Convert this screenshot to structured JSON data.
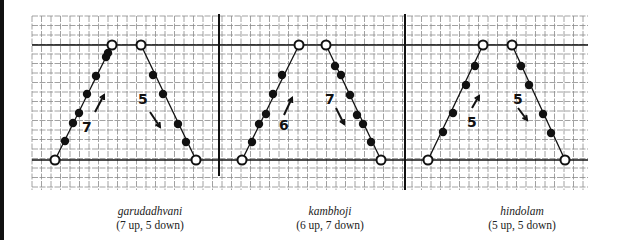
{
  "figure": {
    "grid": {
      "x0": 32,
      "x1": 588,
      "y0": 16,
      "y1": 190,
      "spacing": 9.5,
      "color": "#8a8a8a"
    },
    "bold_lines": {
      "horizontal": [
        45,
        160
      ],
      "vertical": [
        {
          "x": 219,
          "y0": 14,
          "y1": 176
        },
        {
          "x": 405,
          "y0": 14,
          "y1": 190
        }
      ],
      "color": "#111111"
    },
    "panels": [
      {
        "name": "garudadhvani",
        "counts": "(7 up, 5 down)",
        "caption_x": 150,
        "up_label": "7",
        "down_label": "5",
        "up_label_pos": [
          82,
          132
        ],
        "up_arrow": [
          [
            95,
            112
          ],
          [
            104,
            95
          ]
        ],
        "down_label_pos": [
          138,
          104
        ],
        "down_arrow": [
          [
            150,
            112
          ],
          [
            160,
            127
          ]
        ],
        "ascent": {
          "start": [
            55,
            160
          ],
          "end": [
            112,
            45
          ],
          "notes": [
            [
              65,
              141
            ],
            [
              73,
              123
            ],
            [
              79,
              113
            ],
            [
              87,
              94
            ],
            [
              96,
              76
            ],
            [
              106,
              57
            ],
            [
              108,
              53
            ]
          ]
        },
        "descent": {
          "start": [
            141,
            45
          ],
          "end": [
            196,
            160
          ],
          "notes": [
            [
              153,
              75
            ],
            [
              163,
              94
            ],
            [
              178,
              124
            ],
            [
              186,
              142
            ]
          ]
        }
      },
      {
        "name": "kambhoji",
        "counts": "(6 up, 7 down)",
        "caption_x": 330,
        "up_label": "6",
        "down_label": "7",
        "up_label_pos": [
          279,
          130
        ],
        "up_arrow": [
          [
            284,
            115
          ],
          [
            292,
            98
          ]
        ],
        "down_label_pos": [
          325,
          104
        ],
        "down_arrow": [
          [
            336,
            108
          ],
          [
            344,
            124
          ]
        ],
        "ascent": {
          "start": [
            242,
            160
          ],
          "end": [
            299,
            45
          ],
          "notes": [
            [
              252,
              142
            ],
            [
              259,
              124
            ],
            [
              266,
              114
            ],
            [
              273,
              94
            ],
            [
              282,
              75
            ]
          ]
        },
        "descent": {
          "start": [
            326,
            45
          ],
          "end": [
            381,
            160
          ],
          "notes": [
            [
              335,
              66
            ],
            [
              341,
              75
            ],
            [
              350,
              95
            ],
            [
              357,
              115
            ],
            [
              363,
              124
            ],
            [
              371,
              142
            ]
          ]
        }
      },
      {
        "name": "hindolam",
        "counts": "(5 up, 5 down)",
        "caption_x": 522,
        "up_label": "5",
        "down_label": "5",
        "up_label_pos": [
          467,
          127
        ],
        "up_arrow": [
          [
            472,
            108
          ],
          [
            479,
            96
          ]
        ],
        "down_label_pos": [
          513,
          104
        ],
        "down_arrow": [
          [
            518,
            108
          ],
          [
            527,
            120
          ]
        ],
        "ascent": {
          "start": [
            428,
            160
          ],
          "end": [
            483,
            45
          ],
          "notes": [
            [
              443,
              132
            ],
            [
              453,
              113
            ],
            [
              466,
              85
            ],
            [
              475,
              66
            ]
          ]
        },
        "descent": {
          "start": [
            512,
            45
          ],
          "end": [
            565,
            160
          ],
          "notes": [
            [
              521,
              66
            ],
            [
              529,
              85
            ],
            [
              543,
              114
            ],
            [
              551,
              133
            ]
          ]
        }
      }
    ]
  }
}
